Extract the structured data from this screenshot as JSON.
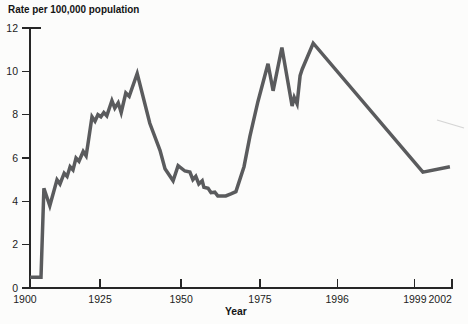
{
  "chart_data": {
    "type": "line",
    "title": "Rate per 100,000 population",
    "xlabel": "Year",
    "ylabel": "",
    "ylim": [
      0,
      12
    ],
    "grid": false,
    "legend": false,
    "line_color": "#5a5b5d",
    "axis_color": "#262626",
    "y_ticks": [
      0,
      2,
      4,
      6,
      8,
      10,
      12
    ],
    "x_axis_note": "tick spacing non-linear as printed",
    "x_ticks": [
      {
        "label": "1900",
        "frac": 0.0,
        "tick": false,
        "label_frac": -0.012
      },
      {
        "label": "1925",
        "frac": 0.166,
        "tick": true
      },
      {
        "label": "1950",
        "frac": 0.358,
        "tick": true
      },
      {
        "label": "1975",
        "frac": 0.545,
        "tick": true
      },
      {
        "label": "1996",
        "frac": 0.728,
        "tick": true
      },
      {
        "label": "1999",
        "frac": 0.912,
        "tick": true
      },
      {
        "label": "2002",
        "frac": 1.0,
        "tick": true,
        "label_frac": 0.972
      }
    ],
    "series": [
      {
        "points_format": [
          "year",
          "rate",
          "x_frac_as_printed"
        ],
        "points": [
          [
            1900,
            0.5,
            0.0
          ],
          [
            1905,
            0.5,
            0.026
          ],
          [
            1906,
            4.6,
            0.033
          ],
          [
            1908,
            3.8,
            0.047
          ],
          [
            1910,
            5.0,
            0.064
          ],
          [
            1911,
            4.8,
            0.071
          ],
          [
            1912,
            5.3,
            0.081
          ],
          [
            1913,
            5.15,
            0.088
          ],
          [
            1914,
            5.6,
            0.095
          ],
          [
            1915,
            5.45,
            0.102
          ],
          [
            1916,
            6.0,
            0.109
          ],
          [
            1917,
            5.85,
            0.116
          ],
          [
            1918,
            6.3,
            0.126
          ],
          [
            1919,
            6.1,
            0.133
          ],
          [
            1920,
            6.6,
            0.137
          ],
          [
            1921,
            7.9,
            0.147
          ],
          [
            1922,
            7.7,
            0.154
          ],
          [
            1923,
            8.0,
            0.161
          ],
          [
            1924,
            7.9,
            0.168
          ],
          [
            1925,
            8.1,
            0.175
          ],
          [
            1926,
            7.95,
            0.182
          ],
          [
            1927,
            8.65,
            0.194
          ],
          [
            1928,
            8.3,
            0.201
          ],
          [
            1929,
            8.55,
            0.209
          ],
          [
            1930,
            8.1,
            0.216
          ],
          [
            1931,
            9.0,
            0.227
          ],
          [
            1932,
            8.85,
            0.235
          ],
          [
            1933,
            9.9,
            0.254
          ],
          [
            1937,
            7.6,
            0.284
          ],
          [
            1940,
            6.35,
            0.308
          ],
          [
            1942,
            5.5,
            0.32
          ],
          [
            1944,
            4.95,
            0.339
          ],
          [
            1946,
            5.65,
            0.351
          ],
          [
            1948,
            5.4,
            0.367
          ],
          [
            1950,
            5.35,
            0.379
          ],
          [
            1951,
            5.0,
            0.386
          ],
          [
            1952,
            5.15,
            0.393
          ],
          [
            1953,
            4.8,
            0.4
          ],
          [
            1954,
            4.95,
            0.408
          ],
          [
            1955,
            4.65,
            0.412
          ],
          [
            1956,
            4.6,
            0.422
          ],
          [
            1957,
            4.4,
            0.429
          ],
          [
            1958,
            4.42,
            0.438
          ],
          [
            1960,
            4.25,
            0.445
          ],
          [
            1963,
            4.25,
            0.464
          ],
          [
            1964,
            4.35,
            0.476
          ],
          [
            1966,
            4.45,
            0.488
          ],
          [
            1968,
            5.6,
            0.507
          ],
          [
            1970,
            7.0,
            0.521
          ],
          [
            1972,
            8.6,
            0.54
          ],
          [
            1974,
            10.35,
            0.564
          ],
          [
            1976,
            9.1,
            0.576
          ],
          [
            1980,
            11.1,
            0.597
          ],
          [
            1983,
            8.4,
            0.621
          ],
          [
            1984,
            8.8,
            0.626
          ],
          [
            1985,
            8.5,
            0.633
          ],
          [
            1987,
            9.8,
            0.64
          ],
          [
            1988,
            10.1,
            0.645
          ],
          [
            1991,
            11.3,
            0.671
          ],
          [
            2000,
            5.35,
            0.931
          ],
          [
            2002,
            5.6,
            0.995
          ]
        ]
      }
    ],
    "scan_artifact_line": {
      "x1": 437,
      "y1": 120,
      "x2": 464,
      "y2": 128,
      "color": "#cccccc"
    }
  }
}
